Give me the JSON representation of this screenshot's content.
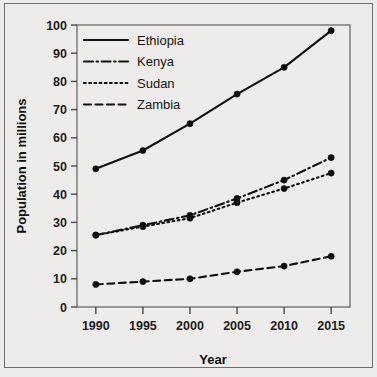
{
  "chart_data": {
    "type": "line",
    "title": "",
    "xlabel": "Year",
    "ylabel": "Population in millions",
    "x": [
      1990,
      1995,
      2000,
      2005,
      2010,
      2015
    ],
    "categories": [
      "1990",
      "1995",
      "2000",
      "2005",
      "2010",
      "2015"
    ],
    "xlim": [
      1988,
      2017
    ],
    "ylim": [
      0,
      100
    ],
    "ytick_labels": [
      "0",
      "10",
      "20",
      "30",
      "40",
      "50",
      "60",
      "70",
      "80",
      "90",
      "100"
    ],
    "ytick_values": [
      0,
      10,
      20,
      30,
      40,
      50,
      60,
      70,
      80,
      90,
      100
    ],
    "grid": false,
    "legend_position": "top-left",
    "series": [
      {
        "name": "Ethiopia",
        "style": "solid",
        "values": [
          49,
          55.5,
          65,
          75.5,
          85,
          98
        ]
      },
      {
        "name": "Kenya",
        "style": "dash-dot",
        "values": [
          25.5,
          29,
          32.5,
          38.5,
          45,
          53
        ]
      },
      {
        "name": "Sudan",
        "style": "dotted",
        "values": [
          25.5,
          28.5,
          31.5,
          37,
          42,
          47.5
        ]
      },
      {
        "name": "Zambia",
        "style": "dashed",
        "values": [
          8,
          9,
          10,
          12.5,
          14.5,
          18
        ]
      }
    ]
  },
  "legend": {
    "items": [
      {
        "label": "Ethiopia",
        "style": "solid"
      },
      {
        "label": "Kenya",
        "style": "dash-dot"
      },
      {
        "label": "Sudan",
        "style": "dotted"
      },
      {
        "label": "Zambia",
        "style": "dashed"
      }
    ]
  },
  "colors": {
    "ink": "#111111",
    "axis": "#4b4b4b",
    "paper": "#edecea",
    "frame": "#6e6e6e"
  }
}
